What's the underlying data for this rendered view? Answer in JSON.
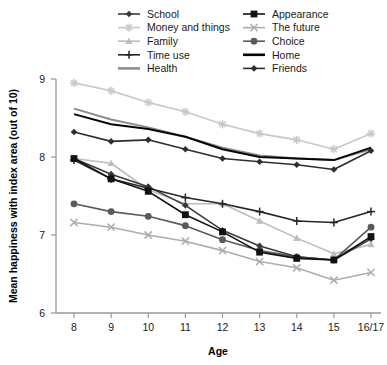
{
  "chart_data": {
    "type": "line",
    "title": "",
    "xlabel": "Age",
    "ylabel": "Mean happiness with index area (out of 10)",
    "categories": [
      "8",
      "9",
      "10",
      "11",
      "12",
      "13",
      "14",
      "15",
      "16/17"
    ],
    "ylim": [
      6,
      9
    ],
    "yticks": [
      "6",
      "7",
      "8",
      "9"
    ],
    "grid": false,
    "legend_position": "top",
    "series": [
      {
        "name": "School",
        "color": "#3a3a3a",
        "marker": "diamond",
        "values": [
          7.98,
          7.78,
          7.62,
          7.38,
          7.06,
          6.86,
          6.72,
          6.68,
          6.95
        ]
      },
      {
        "name": "Money and things",
        "color": "#c8c8c8",
        "marker": "star",
        "values": [
          8.95,
          8.85,
          8.7,
          8.58,
          8.42,
          8.3,
          8.22,
          8.1,
          8.3
        ]
      },
      {
        "name": "Family",
        "color": "#bdbdbd",
        "marker": "triangle",
        "values": [
          7.98,
          7.92,
          7.58,
          7.4,
          7.4,
          7.18,
          6.96,
          6.76,
          6.88
        ]
      },
      {
        "name": "Time use",
        "color": "#262626",
        "marker": "plus",
        "values": [
          7.96,
          7.72,
          7.6,
          7.48,
          7.4,
          7.3,
          7.18,
          7.16,
          7.3
        ]
      },
      {
        "name": "Health",
        "color": "#8c8c8c",
        "marker": "line",
        "values": [
          8.62,
          8.48,
          8.38,
          8.26,
          8.12,
          8.02,
          7.98,
          7.96,
          8.1
        ]
      },
      {
        "name": "Appearance",
        "color": "#111111",
        "marker": "square",
        "values": [
          7.98,
          7.72,
          7.56,
          7.26,
          7.04,
          6.78,
          6.7,
          6.68,
          6.98
        ]
      },
      {
        "name": "The future",
        "color": "#adadad",
        "marker": "cross",
        "values": [
          7.16,
          7.1,
          7.0,
          6.92,
          6.8,
          6.66,
          6.58,
          6.42,
          6.52
        ]
      },
      {
        "name": "Choice",
        "color": "#5a5a5a",
        "marker": "circle",
        "values": [
          7.4,
          7.3,
          7.24,
          7.12,
          6.94,
          6.8,
          6.72,
          6.68,
          7.1
        ]
      },
      {
        "name": "Home",
        "color": "#050505",
        "marker": "line",
        "values": [
          8.55,
          8.42,
          8.36,
          8.26,
          8.1,
          8.0,
          7.98,
          7.96,
          8.12
        ]
      },
      {
        "name": "Friends",
        "color": "#2e2e2e",
        "marker": "diamond",
        "values": [
          8.32,
          8.2,
          8.22,
          8.1,
          7.98,
          7.94,
          7.9,
          7.84,
          8.08
        ]
      }
    ]
  },
  "legend": {
    "column1": [
      "School",
      "Money and things",
      "Family",
      "Time use",
      "Health"
    ],
    "column2": [
      "Appearance",
      "The future",
      "Choice",
      "Home",
      "Friends"
    ]
  }
}
